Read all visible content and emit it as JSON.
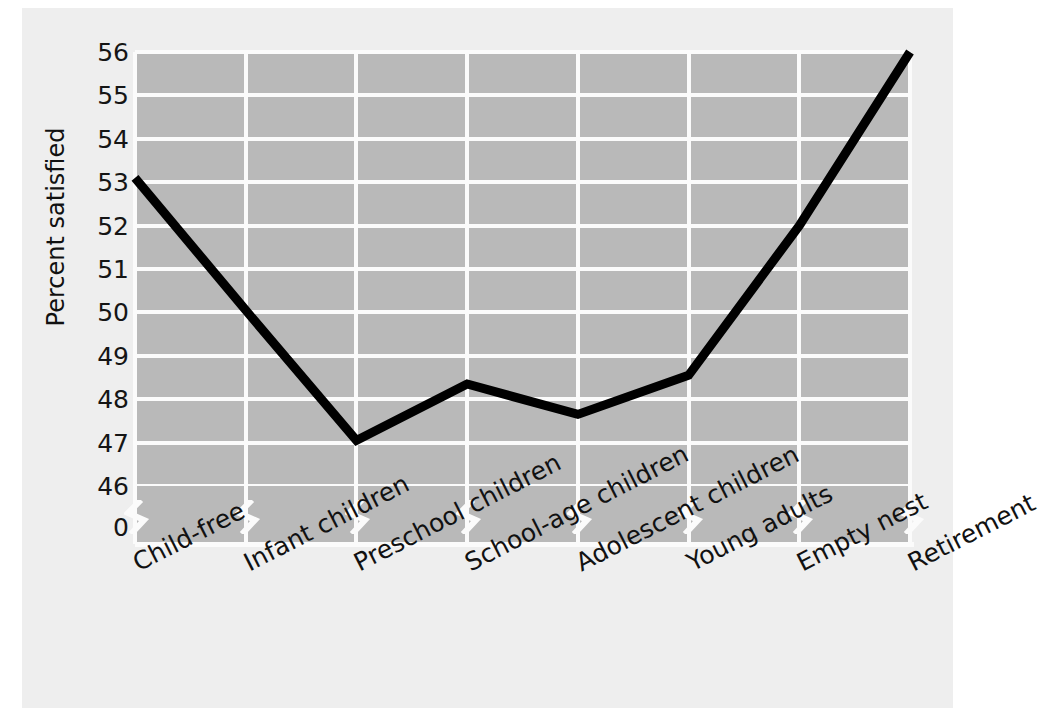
{
  "chart_data": {
    "type": "line",
    "title": "",
    "xlabel": "",
    "ylabel": "Percent satisfied",
    "categories": [
      "Child-free",
      "Infant children",
      "Preschool children",
      "School-age children",
      "Adolescent children",
      "Young adults",
      "Empty nest",
      "Retirement"
    ],
    "values": [
      53.1,
      50.05,
      47.05,
      48.35,
      47.65,
      48.55,
      52.0,
      56.0
    ],
    "ylim": [
      46,
      56
    ],
    "yticks": [
      56,
      55,
      54,
      53,
      52,
      51,
      50,
      49,
      48,
      47,
      46
    ],
    "ytick_labels": [
      "56",
      "55",
      "54",
      "53",
      "52",
      "51",
      "50",
      "49",
      "48",
      "47",
      "46"
    ],
    "axis_break_label": "0",
    "axis_break": true,
    "grid": true,
    "legend": false,
    "series": [
      {
        "name": "Percent satisfied",
        "values": [
          53.1,
          50.05,
          47.05,
          48.35,
          47.65,
          48.55,
          52.0,
          56.0
        ]
      }
    ],
    "colors": {
      "plot_background": "#b9b9b9",
      "figure_background": "#eeeeee",
      "gridline": "#fbfbfb",
      "line": "#000000",
      "text": "#111111"
    }
  }
}
